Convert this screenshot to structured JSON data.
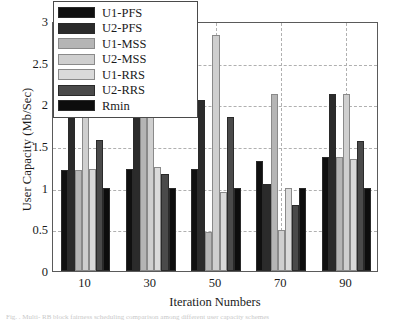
{
  "chart_data": {
    "type": "bar",
    "title": "",
    "xlabel": "Iteration Numbers",
    "ylabel": "User Capacity (Mb/Sec)",
    "categories": [
      "10",
      "30",
      "50",
      "70",
      "90"
    ],
    "ylim": [
      0,
      3
    ],
    "yticks": [
      "0",
      "0.5",
      "1",
      "1.5",
      "2",
      "2.5",
      "3"
    ],
    "ytick_values": [
      0,
      0.5,
      1,
      1.5,
      2,
      2.5,
      3
    ],
    "grid": true,
    "legend_position": "upper-left-inside",
    "series": [
      {
        "name": "U1-PFS",
        "color": "#101010",
        "values": [
          1.21,
          1.23,
          1.22,
          1.32,
          1.37
        ]
      },
      {
        "name": "U2-PFS",
        "color": "#2b2b2b",
        "values": [
          2.43,
          1.9,
          2.05,
          1.05,
          2.13
        ]
      },
      {
        "name": "U1-MSS",
        "color": "#b5b5b5",
        "values": [
          1.21,
          1.92,
          0.47,
          2.12,
          1.37
        ]
      },
      {
        "name": "U2-MSS",
        "color": "#cfcfcf",
        "values": [
          2.43,
          1.88,
          2.83,
          0.49,
          2.13
        ]
      },
      {
        "name": "U1-RRS",
        "color": "#dadada",
        "values": [
          1.22,
          1.25,
          0.95,
          1.0,
          1.35
        ]
      },
      {
        "name": "U2-RRS",
        "color": "#4a4a4a",
        "values": [
          1.57,
          1.17,
          1.85,
          0.79,
          1.56
        ]
      },
      {
        "name": "Rmin",
        "color": "#0d0d0d",
        "values": [
          1.0,
          1.0,
          1.0,
          1.0,
          1.0
        ]
      }
    ]
  },
  "legend": {
    "items": [
      {
        "label": "U1-PFS"
      },
      {
        "label": "U2-PFS"
      },
      {
        "label": "U1-MSS"
      },
      {
        "label": "U2-MSS"
      },
      {
        "label": "U1-RRS"
      },
      {
        "label": "U2-RRS"
      },
      {
        "label": "Rmin"
      }
    ]
  },
  "caption": {
    "text": "Fig.  .  Multi-  RB  block   fairness  scheduling  comparison  among  different  user  capacity  schemes"
  }
}
